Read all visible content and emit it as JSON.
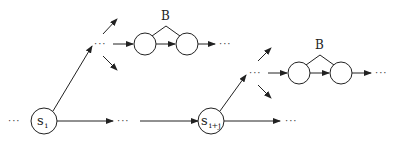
{
  "diagram": {
    "type": "state-transition-chain",
    "nodes": {
      "s_i": {
        "label": "s",
        "subscript": "i"
      },
      "s_i_plus_j": {
        "label": "s",
        "subscript": "i+j"
      }
    },
    "groups": [
      {
        "label": "B"
      },
      {
        "label": "B"
      }
    ],
    "ellipsis": "···"
  }
}
